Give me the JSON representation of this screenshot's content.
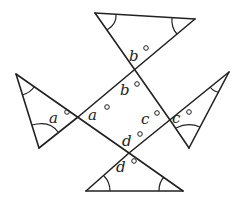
{
  "figure": {
    "stroke_color": "#222222",
    "background_color": "#ffffff",
    "labels": {
      "b_top": "b",
      "b_bottom": "b",
      "a_left": "a",
      "a_right": "a",
      "c_left": "c",
      "c_right": "c",
      "d_top": "d",
      "d_bottom": "d"
    },
    "degree_symbol": "°"
  }
}
